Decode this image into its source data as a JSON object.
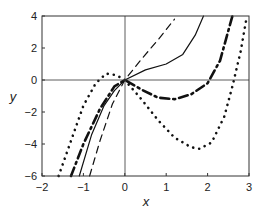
{
  "chart_data": {
    "type": "line",
    "title": "",
    "xlabel": "x",
    "ylabel": "y",
    "xlim": [
      -2,
      3
    ],
    "ylim": [
      -6,
      4
    ],
    "xticks": [
      "-2",
      "-1",
      "0",
      "1",
      "2",
      "3"
    ],
    "yticks": [
      "-6",
      "-4",
      "-2",
      "0",
      "2",
      "4"
    ],
    "grid": false,
    "legend": null,
    "series": [
      {
        "name": "solid",
        "style": "solid",
        "x": [
          -1.1,
          -0.8,
          -0.5,
          -0.25,
          0,
          0.5,
          1.0,
          1.4,
          1.7,
          1.9
        ],
        "y": [
          -6.0,
          -3.4,
          -1.6,
          -0.66,
          0,
          0.63,
          1.0,
          1.6,
          2.8,
          4.0
        ]
      },
      {
        "name": "dashed",
        "style": "dashed",
        "x": [
          -0.85,
          -0.6,
          -0.3,
          0,
          0.4,
          0.8,
          1.2
        ],
        "y": [
          -6.0,
          -3.8,
          -1.5,
          0,
          1.3,
          2.5,
          3.8
        ]
      },
      {
        "name": "dash-dot",
        "style": "dash-dot",
        "x": [
          -1.3,
          -1.0,
          -0.6,
          -0.25,
          0,
          0.4,
          0.8,
          1.2,
          1.6,
          2.0,
          2.3,
          2.6
        ],
        "y": [
          -6.0,
          -4.0,
          -1.8,
          -0.4,
          0,
          -0.6,
          -1.1,
          -1.2,
          -0.9,
          -0.2,
          1.2,
          4.0
        ]
      },
      {
        "name": "dotted",
        "style": "dotted",
        "x": [
          -1.6,
          -1.3,
          -1.0,
          -0.7,
          -0.45,
          -0.2,
          0,
          0.4,
          0.8,
          1.2,
          1.6,
          1.8,
          2.1,
          2.4,
          2.6,
          2.8,
          2.95
        ],
        "y": [
          -6.0,
          -3.8,
          -1.6,
          -0.2,
          0.4,
          0.3,
          0,
          -1.2,
          -2.5,
          -3.6,
          -4.2,
          -4.3,
          -3.9,
          -2.3,
          -0.4,
          1.8,
          4.0
        ]
      }
    ]
  }
}
